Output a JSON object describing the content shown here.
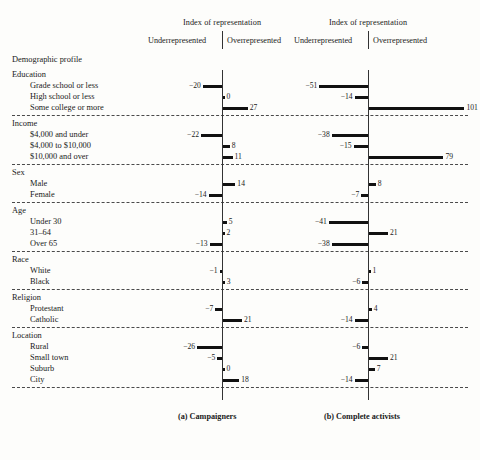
{
  "figure": {
    "profile_title": "Demographic profile",
    "axis_title": "Index of representation",
    "left_side_label": "Underrepresented",
    "right_side_label": "Overrepresented",
    "panels": [
      {
        "caption": "(a)  Campaigners"
      },
      {
        "caption": "(b)  Complete activists"
      }
    ]
  },
  "chart_data": {
    "type": "bar",
    "title": "Index of representation",
    "subtitle": "Demographic profile",
    "orientation": "horizontal",
    "xlabel": "Index of representation",
    "ylabel": "Demographic profile",
    "negative_direction_label": "Underrepresented",
    "positive_direction_label": "Overrepresented",
    "grid": false,
    "legend": "none",
    "xlim": [
      -55,
      105
    ],
    "panels": [
      {
        "name": "Campaigners",
        "caption": "(a)  Campaigners",
        "values": [
          -20,
          0,
          27,
          -22,
          8,
          11,
          14,
          -14,
          5,
          2,
          -13,
          -1,
          3,
          -7,
          21,
          -26,
          -5,
          0,
          18
        ]
      },
      {
        "name": "Complete activists",
        "caption": "(b)  Complete activists",
        "values": [
          -51,
          -14,
          101,
          -38,
          -15,
          79,
          8,
          -7,
          -41,
          21,
          -38,
          1,
          -6,
          4,
          -14,
          -6,
          21,
          7,
          -14
        ]
      }
    ],
    "groups": [
      {
        "group": "Education",
        "rows": [
          {
            "label": "Grade school or less",
            "a": -20,
            "b": -51
          },
          {
            "label": "High school or less",
            "a": 0,
            "b": -14
          },
          {
            "label": "Some college or more",
            "a": 27,
            "b": 101
          }
        ]
      },
      {
        "group": "Income",
        "rows": [
          {
            "label": "$4,000 and under",
            "a": -22,
            "b": -38
          },
          {
            "label": "$4,000 to $10,000",
            "a": 8,
            "b": -15
          },
          {
            "label": "$10,000 and over",
            "a": 11,
            "b": 79
          }
        ]
      },
      {
        "group": "Sex",
        "rows": [
          {
            "label": "Male",
            "a": 14,
            "b": 8
          },
          {
            "label": "Female",
            "a": -14,
            "b": -7
          }
        ]
      },
      {
        "group": "Age",
        "rows": [
          {
            "label": "Under 30",
            "a": 5,
            "b": -41
          },
          {
            "label": "31–64",
            "a": 2,
            "b": 21
          },
          {
            "label": "Over 65",
            "a": -13,
            "b": -38
          }
        ]
      },
      {
        "group": "Race",
        "rows": [
          {
            "label": "White",
            "a": -1,
            "b": 1
          },
          {
            "label": "Black",
            "a": 3,
            "b": -6
          }
        ]
      },
      {
        "group": "Religion",
        "rows": [
          {
            "label": "Protestant",
            "a": -7,
            "b": 4
          },
          {
            "label": "Catholic",
            "a": 21,
            "b": -14
          }
        ]
      },
      {
        "group": "Location",
        "rows": [
          {
            "label": "Rural",
            "a": -26,
            "b": -6
          },
          {
            "label": "Small town",
            "a": -5,
            "b": 21
          },
          {
            "label": "Suburb",
            "a": 0,
            "b": 7
          },
          {
            "label": "City",
            "a": 18,
            "b": -14
          }
        ]
      }
    ]
  },
  "colors": {
    "bar": "#111111",
    "axis": "#333333",
    "divider": "#4a4a4a",
    "background": "#fdfdfb",
    "text": "#1a1a1a"
  }
}
